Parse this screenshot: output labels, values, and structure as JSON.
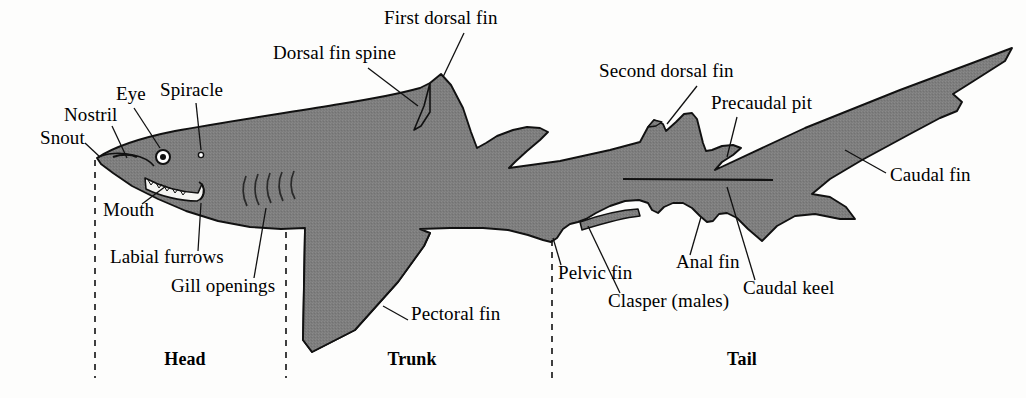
{
  "figure": {
    "colors": {
      "body_fill": "#7d7d7d",
      "outline": "#111111",
      "background": "#fdfdfc",
      "text": "#000000"
    }
  },
  "labels": [
    {
      "id": "snout",
      "text": "Snout",
      "x": 40,
      "y": 137,
      "align": "left"
    },
    {
      "id": "nostril",
      "text": "Nostril",
      "x": 64,
      "y": 114,
      "align": "left"
    },
    {
      "id": "eye",
      "text": "Eye",
      "x": 116,
      "y": 93,
      "align": "left"
    },
    {
      "id": "spiracle",
      "text": "Spiracle",
      "x": 160,
      "y": 89,
      "align": "left"
    },
    {
      "id": "mouth",
      "text": "Mouth",
      "x": 103,
      "y": 209,
      "align": "left"
    },
    {
      "id": "labial-furrows",
      "text": "Labial furrows",
      "x": 110,
      "y": 256,
      "align": "left"
    },
    {
      "id": "gill-openings",
      "text": "Gill openings",
      "x": 171,
      "y": 285,
      "align": "left"
    },
    {
      "id": "dorsal-fin-spine",
      "text": "Dorsal fin spine",
      "x": 273,
      "y": 52,
      "align": "left"
    },
    {
      "id": "first-dorsal-fin",
      "text": "First dorsal fin",
      "x": 384,
      "y": 17,
      "align": "left"
    },
    {
      "id": "second-dorsal-fin",
      "text": "Second dorsal fin",
      "x": 599,
      "y": 70,
      "align": "left"
    },
    {
      "id": "precaudal-pit",
      "text": "Precaudal pit",
      "x": 711,
      "y": 102,
      "align": "left"
    },
    {
      "id": "caudal-fin",
      "text": "Caudal fin",
      "x": 890,
      "y": 174,
      "align": "left"
    },
    {
      "id": "pectoral-fin",
      "text": "Pectoral fin",
      "x": 411,
      "y": 313,
      "align": "left"
    },
    {
      "id": "pelvic-fin",
      "text": "Pelvic fin",
      "x": 558,
      "y": 272,
      "align": "left"
    },
    {
      "id": "clasper",
      "text": "Clasper (males)",
      "x": 608,
      "y": 300,
      "align": "left"
    },
    {
      "id": "anal-fin",
      "text": "Anal fin",
      "x": 676,
      "y": 261,
      "align": "left"
    },
    {
      "id": "caudal-keel",
      "text": "Caudal keel",
      "x": 743,
      "y": 287,
      "align": "left"
    }
  ],
  "regions": [
    {
      "id": "head",
      "text": "Head",
      "x": 185,
      "y": 358
    },
    {
      "id": "trunk",
      "text": "Trunk",
      "x": 412,
      "y": 358
    },
    {
      "id": "tail",
      "text": "Tail",
      "x": 742,
      "y": 358
    }
  ],
  "region_dividers": [
    {
      "id": "head-trunk-divider",
      "x": 95,
      "y1": 160,
      "y2": 378
    },
    {
      "id": "trunk-tail-divider",
      "x": 286,
      "y1": 232,
      "y2": 378
    },
    {
      "id": "tail-start-divider",
      "x": 552,
      "y1": 240,
      "y2": 378
    }
  ],
  "features": {
    "gill_slit_count": 5,
    "lateral_line": {
      "x1": 623,
      "y1": 179,
      "x2": 773,
      "y2": 180
    }
  }
}
